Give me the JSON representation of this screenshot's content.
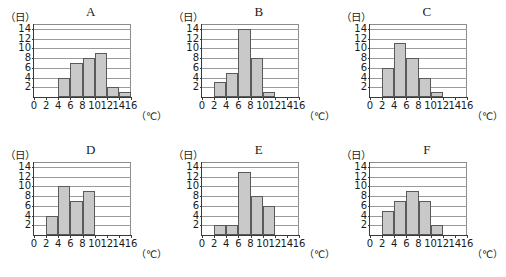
{
  "figure": {
    "y_unit_label": "（日）",
    "x_unit_label": "（℃）",
    "y_ticks": [
      2,
      4,
      6,
      8,
      10,
      12,
      14
    ],
    "x_ticks": [
      0,
      2,
      4,
      6,
      8,
      10,
      12,
      14,
      16
    ],
    "y_max": 15,
    "x_min": 0,
    "x_max": 16,
    "bar_fill": "#c9c9c9",
    "bar_stroke": "#5a5a5a",
    "grid_color": "#9a9a9a",
    "axis_color": "#3a3a3a"
  },
  "chart_data": [
    {
      "type": "bar",
      "title": "A",
      "xlabel": "（℃）",
      "ylabel": "（日）",
      "xlim": [
        0,
        16
      ],
      "ylim": [
        0,
        15
      ],
      "grid": true,
      "bin_width": 2,
      "categories": [
        "0-2",
        "2-4",
        "4-6",
        "6-8",
        "8-10",
        "10-12",
        "12-14",
        "14-16"
      ],
      "bin_starts": [
        0,
        2,
        4,
        6,
        8,
        10,
        12,
        14
      ],
      "values": [
        0,
        0,
        4,
        7,
        8,
        9,
        2,
        1
      ]
    },
    {
      "type": "bar",
      "title": "B",
      "xlabel": "（℃）",
      "ylabel": "（日）",
      "xlim": [
        0,
        16
      ],
      "ylim": [
        0,
        15
      ],
      "grid": true,
      "bin_width": 2,
      "categories": [
        "0-2",
        "2-4",
        "4-6",
        "6-8",
        "8-10",
        "10-12",
        "12-14",
        "14-16"
      ],
      "bin_starts": [
        0,
        2,
        4,
        6,
        8,
        10,
        12,
        14
      ],
      "values": [
        0,
        3,
        5,
        14,
        8,
        1,
        0,
        0
      ]
    },
    {
      "type": "bar",
      "title": "C",
      "xlabel": "（℃）",
      "ylabel": "（日）",
      "xlim": [
        0,
        16
      ],
      "ylim": [
        0,
        15
      ],
      "grid": true,
      "bin_width": 2,
      "categories": [
        "0-2",
        "2-4",
        "4-6",
        "6-8",
        "8-10",
        "10-12",
        "12-14",
        "14-16"
      ],
      "bin_starts": [
        0,
        2,
        4,
        6,
        8,
        10,
        12,
        14
      ],
      "values": [
        0,
        6,
        11,
        8,
        4,
        1,
        0,
        0
      ]
    },
    {
      "type": "bar",
      "title": "D",
      "xlabel": "（℃）",
      "ylabel": "（日）",
      "xlim": [
        0,
        16
      ],
      "ylim": [
        0,
        15
      ],
      "grid": true,
      "bin_width": 2,
      "categories": [
        "0-2",
        "2-4",
        "4-6",
        "6-8",
        "8-10",
        "10-12",
        "12-14",
        "14-16"
      ],
      "bin_starts": [
        0,
        2,
        4,
        6,
        8,
        10,
        12,
        14
      ],
      "values": [
        0,
        4,
        10,
        7,
        9,
        0,
        0,
        0
      ]
    },
    {
      "type": "bar",
      "title": "E",
      "xlabel": "（℃）",
      "ylabel": "（日）",
      "xlim": [
        0,
        16
      ],
      "ylim": [
        0,
        15
      ],
      "grid": true,
      "bin_width": 2,
      "categories": [
        "0-2",
        "2-4",
        "4-6",
        "6-8",
        "8-10",
        "10-12",
        "12-14",
        "14-16"
      ],
      "bin_starts": [
        0,
        2,
        4,
        6,
        8,
        10,
        12,
        14
      ],
      "values": [
        0,
        2,
        2,
        13,
        8,
        6,
        0,
        0
      ]
    },
    {
      "type": "bar",
      "title": "F",
      "xlabel": "（℃）",
      "ylabel": "（日）",
      "xlim": [
        0,
        16
      ],
      "ylim": [
        0,
        15
      ],
      "grid": true,
      "bin_width": 2,
      "categories": [
        "0-2",
        "2-4",
        "4-6",
        "6-8",
        "8-10",
        "10-12",
        "12-14",
        "14-16"
      ],
      "bin_starts": [
        0,
        2,
        4,
        6,
        8,
        10,
        12,
        14
      ],
      "values": [
        0,
        5,
        7,
        9,
        7,
        2,
        0,
        0
      ]
    }
  ]
}
